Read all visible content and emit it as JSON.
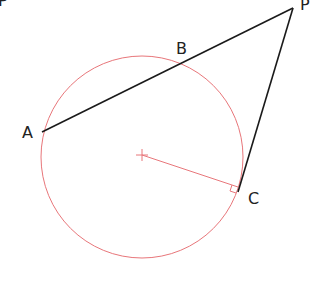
{
  "diagram": {
    "type": "geometry-tangent-secant",
    "colors": {
      "lines": "#1a1a1a",
      "circle": "#e8767a",
      "radius": "#e8767a",
      "labels": "#222222"
    },
    "points": {
      "P": {
        "label": "P",
        "x": 293,
        "y": 8
      },
      "A": {
        "label": "A",
        "x": 42,
        "y": 132
      },
      "B": {
        "label": "B",
        "x": 186,
        "y": 60
      },
      "C": {
        "label": "C",
        "x": 238,
        "y": 190
      },
      "O": {
        "label": "",
        "x": 142,
        "y": 155
      }
    },
    "labels": {
      "P_top_left": "P",
      "P": "P",
      "A": "A",
      "B": "B",
      "C": "C"
    },
    "circle": {
      "cx": 142,
      "cy": 157,
      "r": 101
    },
    "segments": [
      {
        "name": "secant-PA",
        "from": "P",
        "to": "A"
      },
      {
        "name": "tangent-PC",
        "from": "P",
        "to": "C"
      },
      {
        "name": "radius-OC",
        "from": "O",
        "to": "C"
      }
    ],
    "annotations": [
      "right-angle-at-C",
      "center-cross-mark"
    ]
  }
}
